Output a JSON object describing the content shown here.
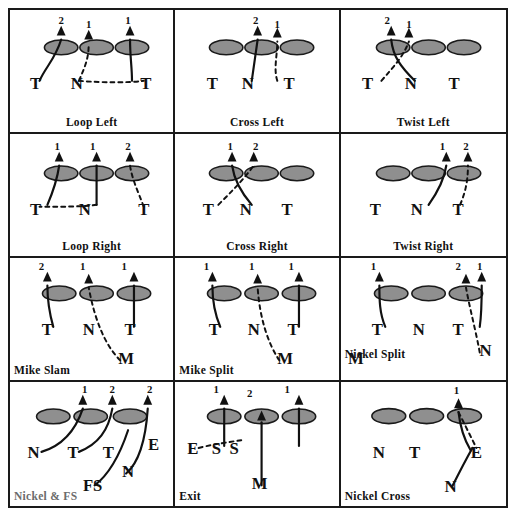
{
  "diagram": {
    "rows": 4,
    "cols": 3,
    "colors": {
      "line": "#111111",
      "oval_fill": "#8f8f8f",
      "oval_stroke": "#1a1a1a",
      "border": "#1a1a1a",
      "gray_text": "#6b6b6b"
    },
    "cells": [
      {
        "id": "loop-left",
        "caption": "Loop Left",
        "caption_pos": "bottom",
        "ovals": [
          {
            "cx": 52,
            "cy": 38
          },
          {
            "cx": 88,
            "cy": 38
          },
          {
            "cx": 124,
            "cy": 38
          }
        ],
        "labels": [
          {
            "text": "T",
            "x": 26,
            "y": 80
          },
          {
            "text": "N",
            "x": 68,
            "y": 80
          },
          {
            "text": "T",
            "x": 138,
            "y": 80
          },
          {
            "text": "2",
            "x": 52,
            "y": 14
          },
          {
            "text": "1",
            "x": 80,
            "y": 18
          },
          {
            "text": "1",
            "x": 120,
            "y": 14
          }
        ],
        "solid_paths": [
          "M 30 72 C 36 58 46 50 52 30",
          "M 124 72 C 124 58 122 48 122 30"
        ],
        "dashed_paths": [
          "M 70 72 C 76 58 80 50 80 34",
          "M 70 72 C 96 74 120 74 136 72"
        ],
        "arrows": [
          {
            "x": 52,
            "y": 22
          },
          {
            "x": 80,
            "y": 26
          },
          {
            "x": 122,
            "y": 22
          }
        ]
      },
      {
        "id": "cross-left",
        "caption": "Cross Left",
        "caption_pos": "bottom",
        "ovals": [
          {
            "cx": 52,
            "cy": 38
          },
          {
            "cx": 88,
            "cy": 38
          },
          {
            "cx": 124,
            "cy": 38
          }
        ],
        "labels": [
          {
            "text": "T",
            "x": 38,
            "y": 80
          },
          {
            "text": "N",
            "x": 74,
            "y": 80
          },
          {
            "text": "T",
            "x": 116,
            "y": 80
          },
          {
            "text": "2",
            "x": 82,
            "y": 14
          },
          {
            "text": "1",
            "x": 104,
            "y": 18
          }
        ],
        "solid_paths": [
          "M 78 72 L 84 30"
        ],
        "dashed_paths": [
          "M 104 72 C 100 60 104 46 104 32"
        ],
        "arrows": [
          {
            "x": 84,
            "y": 22
          },
          {
            "x": 104,
            "y": 24
          }
        ]
      },
      {
        "id": "twist-left",
        "caption": "Twist Left",
        "caption_pos": "bottom",
        "ovals": [
          {
            "cx": 52,
            "cy": 38
          },
          {
            "cx": 88,
            "cy": 38
          },
          {
            "cx": 124,
            "cy": 38
          }
        ],
        "labels": [
          {
            "text": "T",
            "x": 26,
            "y": 80
          },
          {
            "text": "N",
            "x": 70,
            "y": 80
          },
          {
            "text": "T",
            "x": 114,
            "y": 80
          },
          {
            "text": "2",
            "x": 46,
            "y": 14
          },
          {
            "text": "1",
            "x": 68,
            "y": 18
          }
        ],
        "solid_paths": [
          "M 74 72 C 60 58 52 48 50 30"
        ],
        "dashed_paths": [
          "M 40 72 C 52 58 62 48 68 32"
        ],
        "arrows": [
          {
            "x": 50,
            "y": 22
          },
          {
            "x": 68,
            "y": 24
          }
        ]
      },
      {
        "id": "loop-right",
        "caption": "Loop Right",
        "caption_pos": "bottom",
        "ovals": [
          {
            "cx": 52,
            "cy": 40
          },
          {
            "cx": 88,
            "cy": 40
          },
          {
            "cx": 124,
            "cy": 40
          }
        ],
        "labels": [
          {
            "text": "T",
            "x": 26,
            "y": 82
          },
          {
            "text": "N",
            "x": 76,
            "y": 82
          },
          {
            "text": "T",
            "x": 136,
            "y": 82
          },
          {
            "text": "1",
            "x": 48,
            "y": 16
          },
          {
            "text": "1",
            "x": 84,
            "y": 16
          },
          {
            "text": "2",
            "x": 120,
            "y": 16
          }
        ],
        "solid_paths": [
          "M 38 72 C 44 58 48 46 50 32",
          "M 88 72 C 88 58 88 46 88 32"
        ],
        "dashed_paths": [
          "M 88 72 C 74 74 50 74 30 74",
          "M 136 74 C 130 58 124 46 122 32"
        ],
        "arrows": [
          {
            "x": 50,
            "y": 24
          },
          {
            "x": 88,
            "y": 24
          },
          {
            "x": 122,
            "y": 24
          }
        ]
      },
      {
        "id": "cross-right",
        "caption": "Cross  Right",
        "caption_pos": "bottom",
        "ovals": [
          {
            "cx": 52,
            "cy": 40
          },
          {
            "cx": 88,
            "cy": 40
          },
          {
            "cx": 124,
            "cy": 40
          }
        ],
        "labels": [
          {
            "text": "T",
            "x": 34,
            "y": 82
          },
          {
            "text": "N",
            "x": 72,
            "y": 82
          },
          {
            "text": "T",
            "x": 114,
            "y": 82
          },
          {
            "text": "1",
            "x": 56,
            "y": 16
          },
          {
            "text": "2",
            "x": 82,
            "y": 16
          }
        ],
        "solid_paths": [
          "M 78 72 C 66 58 60 46 58 32"
        ],
        "dashed_paths": [
          "M 44 72 C 58 58 70 46 80 32"
        ],
        "arrows": [
          {
            "x": 58,
            "y": 24
          },
          {
            "x": 80,
            "y": 24
          }
        ]
      },
      {
        "id": "twist-right",
        "caption": "Twist Right",
        "caption_pos": "bottom",
        "ovals": [
          {
            "cx": 52,
            "cy": 40
          },
          {
            "cx": 88,
            "cy": 40
          },
          {
            "cx": 124,
            "cy": 40
          }
        ],
        "labels": [
          {
            "text": "T",
            "x": 34,
            "y": 82
          },
          {
            "text": "N",
            "x": 76,
            "y": 82
          },
          {
            "text": "T",
            "x": 118,
            "y": 82
          },
          {
            "text": "1",
            "x": 102,
            "y": 16
          },
          {
            "text": "2",
            "x": 126,
            "y": 16
          }
        ],
        "solid_paths": [
          "M 88 72 C 98 58 104 46 106 32"
        ],
        "dashed_paths": [
          "M 120 72 C 126 58 128 46 128 32"
        ],
        "arrows": [
          {
            "x": 106,
            "y": 24
          },
          {
            "x": 128,
            "y": 24
          }
        ]
      },
      {
        "id": "mike-slam",
        "caption": "Mike Slam",
        "caption_pos": "left",
        "extra_label": {
          "text": "M",
          "x": 118,
          "y": 108
        },
        "ovals": [
          {
            "cx": 50,
            "cy": 36
          },
          {
            "cx": 88,
            "cy": 36
          },
          {
            "cx": 126,
            "cy": 36
          }
        ],
        "labels": [
          {
            "text": "T",
            "x": 38,
            "y": 78
          },
          {
            "text": "N",
            "x": 80,
            "y": 78
          },
          {
            "text": "T",
            "x": 122,
            "y": 78
          },
          {
            "text": "2",
            "x": 32,
            "y": 12
          },
          {
            "text": "1",
            "x": 74,
            "y": 12
          },
          {
            "text": "1",
            "x": 116,
            "y": 12
          }
        ],
        "solid_paths": [
          "M 44 70 C 40 56 38 42 38 28",
          "M 126 70 L 126 28"
        ],
        "dashed_paths": [
          "M 112 104 C 96 88 86 62 80 30"
        ],
        "arrows": [
          {
            "x": 38,
            "y": 20
          },
          {
            "x": 80,
            "y": 22
          },
          {
            "x": 126,
            "y": 20
          }
        ]
      },
      {
        "id": "mike-split",
        "caption": "Mike Split",
        "caption_pos": "left",
        "extra_label": {
          "text": "M",
          "x": 112,
          "y": 108
        },
        "ovals": [
          {
            "cx": 50,
            "cy": 36
          },
          {
            "cx": 88,
            "cy": 36
          },
          {
            "cx": 126,
            "cy": 36
          }
        ],
        "labels": [
          {
            "text": "T",
            "x": 40,
            "y": 78
          },
          {
            "text": "N",
            "x": 80,
            "y": 78
          },
          {
            "text": "T",
            "x": 120,
            "y": 78
          },
          {
            "text": "1",
            "x": 32,
            "y": 12
          },
          {
            "text": "1",
            "x": 78,
            "y": 12
          },
          {
            "text": "1",
            "x": 118,
            "y": 12
          }
        ],
        "solid_paths": [
          "M 46 70 C 40 56 38 42 38 28",
          "M 126 70 L 126 28"
        ],
        "dashed_paths": [
          "M 106 104 C 94 86 86 60 84 30"
        ],
        "arrows": [
          {
            "x": 38,
            "y": 20
          },
          {
            "x": 84,
            "y": 22
          },
          {
            "x": 126,
            "y": 20
          }
        ]
      },
      {
        "id": "nickel-split",
        "caption": "Nickel Split",
        "caption_pos": "left2",
        "extra_label": {
          "text": "M",
          "x": 14,
          "y": 108
        },
        "extra_label2": {
          "text": "N",
          "x": 146,
          "y": 100
        },
        "ovals": [
          {
            "cx": 50,
            "cy": 36
          },
          {
            "cx": 88,
            "cy": 36
          },
          {
            "cx": 126,
            "cy": 36
          }
        ],
        "labels": [
          {
            "text": "T",
            "x": 36,
            "y": 78
          },
          {
            "text": "N",
            "x": 78,
            "y": 78
          },
          {
            "text": "T",
            "x": 118,
            "y": 78
          },
          {
            "text": "1",
            "x": 32,
            "y": 12
          },
          {
            "text": "2",
            "x": 118,
            "y": 12
          },
          {
            "text": "1",
            "x": 140,
            "y": 12
          }
        ],
        "solid_paths": [
          "M 44 70 C 38 56 38 42 38 28",
          "M 140 70 C 142 56 142 42 142 28"
        ],
        "dashed_paths": [
          "M 140 96 C 136 74 130 52 126 30"
        ],
        "arrows": [
          {
            "x": 38,
            "y": 20
          },
          {
            "x": 126,
            "y": 22
          },
          {
            "x": 142,
            "y": 20
          }
        ]
      },
      {
        "id": "nickel-fs",
        "caption": "Nickel & FS",
        "caption_pos": "left",
        "caption_gray": true,
        "ovals": [
          {
            "cx": 44,
            "cy": 34
          },
          {
            "cx": 82,
            "cy": 34
          },
          {
            "cx": 122,
            "cy": 34
          }
        ],
        "labels": [
          {
            "text": "N",
            "x": 24,
            "y": 76
          },
          {
            "text": "T",
            "x": 64,
            "y": 76
          },
          {
            "text": "T",
            "x": 100,
            "y": 76
          },
          {
            "text": "E",
            "x": 146,
            "y": 68
          },
          {
            "text": "N",
            "x": 120,
            "y": 96
          },
          {
            "text": "FS",
            "x": 84,
            "y": 110
          },
          {
            "text": "1",
            "x": 76,
            "y": 10
          },
          {
            "text": "2",
            "x": 104,
            "y": 10
          },
          {
            "text": "2",
            "x": 142,
            "y": 10
          }
        ],
        "solid_paths": [
          "M 32 70 C 52 64 66 50 74 26",
          "M 70 70 C 90 62 100 48 104 26",
          "M 118 92 C 132 80 138 56 140 26",
          "M 86 104 C 102 92 112 72 120 48"
        ],
        "dashed_paths": [],
        "arrows": [
          {
            "x": 74,
            "y": 18
          },
          {
            "x": 104,
            "y": 18
          },
          {
            "x": 140,
            "y": 18
          }
        ]
      },
      {
        "id": "exit",
        "caption": "Exit",
        "caption_pos": "left",
        "extra_label": {
          "text": "M",
          "x": 86,
          "y": 108
        },
        "ovals": [
          {
            "cx": 50,
            "cy": 34
          },
          {
            "cx": 88,
            "cy": 34
          },
          {
            "cx": 126,
            "cy": 34
          }
        ],
        "labels": [
          {
            "text": "E",
            "x": 18,
            "y": 72
          },
          {
            "text": "S",
            "x": 42,
            "y": 72
          },
          {
            "text": "S",
            "x": 60,
            "y": 72
          },
          {
            "text": "1",
            "x": 42,
            "y": 10
          },
          {
            "text": "2",
            "x": 76,
            "y": 14
          },
          {
            "text": "1",
            "x": 114,
            "y": 10
          }
        ],
        "solid_paths": [
          "M 50 64 L 50 26",
          "M 126 64 L 126 26",
          "M 88 104 L 88 40"
        ],
        "dashed_paths": [
          "M 24 66 C 40 62 56 60 68 58"
        ],
        "arrows": [
          {
            "x": 50,
            "y": 18
          },
          {
            "x": 126,
            "y": 18
          },
          {
            "x": 88,
            "y": 34
          }
        ]
      },
      {
        "id": "nickel-cross",
        "caption": "Nickel Cross",
        "caption_pos": "left",
        "ovals": [
          {
            "cx": 48,
            "cy": 34
          },
          {
            "cx": 86,
            "cy": 34
          },
          {
            "cx": 124,
            "cy": 34
          }
        ],
        "labels": [
          {
            "text": "N",
            "x": 38,
            "y": 76
          },
          {
            "text": "T",
            "x": 74,
            "y": 76
          },
          {
            "text": "E",
            "x": 136,
            "y": 76
          },
          {
            "text": "N",
            "x": 110,
            "y": 110
          },
          {
            "text": "1",
            "x": 116,
            "y": 12
          }
        ],
        "solid_paths": [
          "M 130 68 C 124 58 120 48 118 30",
          "M 112 104 C 118 92 124 80 132 66"
        ],
        "dashed_paths": [
          "M 118 30 C 124 42 130 54 136 66"
        ],
        "arrows": [
          {
            "x": 118,
            "y": 22
          }
        ]
      }
    ]
  }
}
